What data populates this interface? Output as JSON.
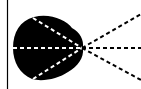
{
  "diagram": {
    "colors": {
      "background": "#ffffff",
      "shape": "#000000",
      "dash_on_shape": "#ffffff",
      "dash_off_shape": "#000000",
      "border": "#000000"
    },
    "focal_point": {
      "x": 82,
      "y": 48
    },
    "rays_left": [
      {
        "from": [
          33,
          18
        ],
        "to": [
          82,
          48
        ]
      },
      {
        "from": [
          13,
          48
        ],
        "to": [
          82,
          48
        ]
      },
      {
        "from": [
          33,
          79
        ],
        "to": [
          82,
          48
        ]
      }
    ],
    "rays_right": [
      {
        "from": [
          82,
          48
        ],
        "to": [
          141,
          14
        ]
      },
      {
        "from": [
          82,
          48
        ],
        "to": [
          141,
          48
        ]
      },
      {
        "from": [
          82,
          48
        ],
        "to": [
          141,
          80
        ]
      }
    ]
  }
}
